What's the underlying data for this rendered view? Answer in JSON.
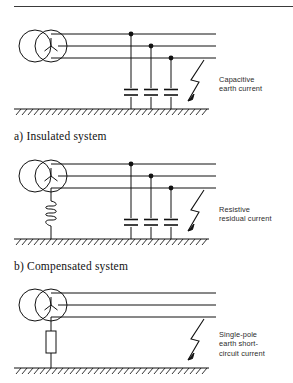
{
  "figure": {
    "title_rule": true,
    "systems": [
      {
        "id": "insulated",
        "caption": "a) Insulated system",
        "annotation": "Capacitive\nearth current",
        "neutral_device": "none",
        "capacitors": 3,
        "fault_symbol": "lightning-bolt-arrow",
        "transformer": "two-winding-wye",
        "phase_lines": 3,
        "ground": "hatched-earth-line"
      },
      {
        "id": "compensated",
        "caption": "b) Compensated system",
        "annotation": "Resistive\nresidual current",
        "neutral_device": "coil",
        "capacitors": 3,
        "fault_symbol": "lightning-bolt-arrow",
        "transformer": "two-winding-wye",
        "phase_lines": 3,
        "ground": "hatched-earth-line"
      },
      {
        "id": "earthed",
        "caption": "c) Earthed system",
        "annotation": "Single-pole\nearth short-\ncircuit current",
        "neutral_device": "resistor",
        "capacitors": 0,
        "fault_symbol": "lightning-bolt-arrow",
        "transformer": "two-winding-wye",
        "phase_lines": 3,
        "ground": "hatched-earth-line"
      }
    ]
  },
  "colors": {
    "line": "#111111",
    "rule": "#3a3a3a",
    "text": "#1a1a1a",
    "background": "#ffffff"
  }
}
